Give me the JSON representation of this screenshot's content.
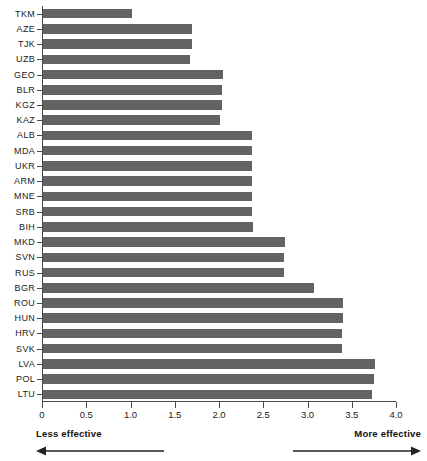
{
  "chart_data": {
    "type": "bar",
    "orientation": "horizontal",
    "title": "",
    "subtitle": "",
    "xlabel": "",
    "ylabel": "",
    "xlim": [
      0,
      4.0
    ],
    "grid": false,
    "legend": null,
    "bar_color": "#636363",
    "axis_color": "#4a4a4a",
    "xticks": [
      0,
      0.5,
      1.0,
      1.5,
      2.0,
      2.5,
      3.0,
      3.5,
      4.0
    ],
    "xtick_labels": [
      "0",
      "0.5",
      "1.0",
      "1.5",
      "2.0",
      "2.5",
      "3.0",
      "3.5",
      "4.0"
    ],
    "categories": [
      "TKM",
      "AZE",
      "TJK",
      "UZB",
      "GEO",
      "BLR",
      "KGZ",
      "KAZ",
      "ALB",
      "MDA",
      "UKR",
      "ARM",
      "MNE",
      "SRB",
      "BIH",
      "MKD",
      "SVN",
      "RUS",
      "BGR",
      "ROU",
      "HUN",
      "HRV",
      "SVK",
      "LVA",
      "POL",
      "LTU"
    ],
    "values": [
      1.0,
      1.68,
      1.68,
      1.66,
      2.03,
      2.02,
      2.02,
      2.0,
      2.36,
      2.36,
      2.36,
      2.36,
      2.36,
      2.36,
      2.37,
      2.74,
      2.72,
      2.72,
      3.06,
      3.39,
      3.39,
      3.38,
      3.38,
      3.75,
      3.74,
      3.72
    ],
    "annotations": [
      {
        "text": "Less effective",
        "position": "bottom-left",
        "arrow": "left"
      },
      {
        "text": "More effective",
        "position": "bottom-right",
        "arrow": "right"
      }
    ]
  }
}
